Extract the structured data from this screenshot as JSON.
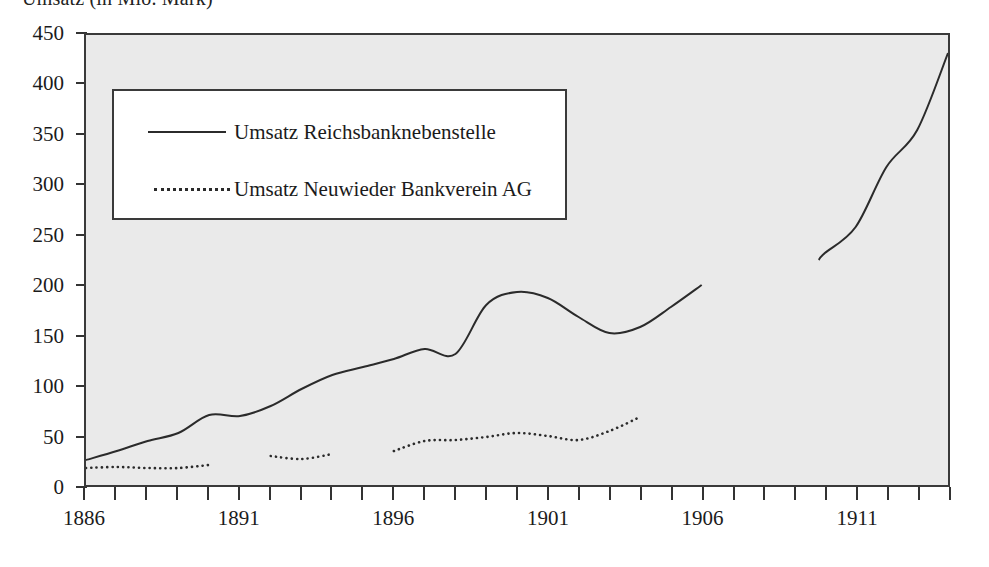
{
  "chart_data": {
    "type": "line",
    "title": "Umsatz (in Mio. Mark)",
    "xlabel": "",
    "ylabel": "Umsatz (in Mio. Mark)",
    "xlim": [
      1886,
      1914
    ],
    "ylim": [
      0,
      450
    ],
    "ytick_step": 50,
    "yticks": [
      0,
      50,
      100,
      150,
      200,
      250,
      300,
      350,
      400,
      450
    ],
    "xticks": [
      1886,
      1887,
      1888,
      1889,
      1890,
      1891,
      1892,
      1893,
      1894,
      1895,
      1896,
      1897,
      1898,
      1899,
      1900,
      1901,
      1902,
      1903,
      1904,
      1905,
      1906,
      1907,
      1908,
      1909,
      1910,
      1911,
      1912,
      1913,
      1914
    ],
    "xtick_labels": [
      1886,
      1891,
      1896,
      1901,
      1906,
      1911
    ],
    "grid": false,
    "legend_position": "upper left inside",
    "series": [
      {
        "name": "Umsatz Reichsbanknebenstelle",
        "style": "solid",
        "color": "#2b2b2b",
        "x": [
          1886,
          1887,
          1888,
          1889,
          1890,
          1891,
          1892,
          1893,
          1894,
          1895,
          1896,
          1897,
          1898,
          1899,
          1900,
          1901,
          1902,
          1903,
          1904,
          1905,
          1906,
          1909.8,
          1910,
          1911,
          1912,
          1913,
          1914
        ],
        "values": [
          25,
          34,
          44,
          52,
          70,
          69,
          79,
          96,
          110,
          118,
          126,
          136,
          131,
          180,
          193,
          187,
          168,
          152,
          158,
          178,
          200,
          225,
          232,
          258,
          318,
          355,
          432
        ],
        "gaps": [
          [
            1906,
            1909.8
          ]
        ]
      },
      {
        "name": "Umsatz Neuwieder Bankverein AG",
        "style": "dotted",
        "color": "#2b2b2b",
        "segments": [
          {
            "x": [
              1886,
              1887,
              1888,
              1889,
              1890
            ],
            "values": [
              17,
              18,
              17,
              17,
              20
            ]
          },
          {
            "x": [
              1892,
              1893,
              1894
            ],
            "values": [
              29,
              26,
              31
            ]
          },
          {
            "x": [
              1896,
              1897,
              1898,
              1899,
              1900,
              1901,
              1902,
              1903,
              1904
            ],
            "values": [
              34,
              44,
              45,
              48,
              52,
              49,
              45,
              54,
              68
            ]
          }
        ]
      }
    ]
  },
  "legend": {
    "entries": [
      {
        "label": "Umsatz Reichsbanknebenstelle",
        "style": "solid"
      },
      {
        "label": "Umsatz Neuwieder Bankverein AG",
        "style": "dotted"
      }
    ]
  },
  "axis": {
    "y_labels": [
      "450",
      "400",
      "350",
      "300",
      "250",
      "200",
      "150",
      "100",
      "50",
      "0"
    ],
    "x_labels": [
      "1886",
      "1891",
      "1896",
      "1901",
      "1906",
      "1911"
    ]
  }
}
